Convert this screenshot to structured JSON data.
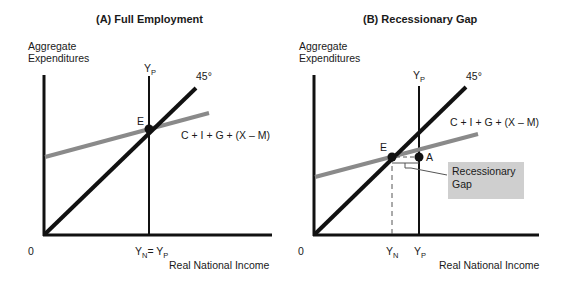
{
  "panel_a": {
    "title": "(A)  Full Employment",
    "y_axis_label_line1": "Aggregate",
    "y_axis_label_line2": "Expenditures",
    "x_axis_label": "Real National Income",
    "origin_label": "0",
    "yp_label": "Y",
    "yp_sub": "P",
    "line45_label": "45°",
    "ae_label": "C + I + G + (X – M)",
    "point_e_label": "E",
    "x_tick_label_y": "Y",
    "x_tick_sub_n": "N",
    "x_tick_eq": "= Y",
    "x_tick_sub_p": "P"
  },
  "panel_b": {
    "title": "(B)  Recessionary Gap",
    "y_axis_label_line1": "Aggregate",
    "y_axis_label_line2": "Expenditures",
    "x_axis_label": "Real National Income",
    "origin_label": "0",
    "yp_label": "Y",
    "yp_sub": "P",
    "line45_label": "45°",
    "ae_label": "C + I + G + (X – M)",
    "point_e_label": "E",
    "point_a_label": "A",
    "gap_label_line1": "Recessionary",
    "gap_label_line2": "Gap",
    "x_tick_yn": "Y",
    "x_tick_yn_sub": "N",
    "x_tick_yp": "Y",
    "x_tick_yp_sub": "P"
  },
  "colors": {
    "axis": "#111111",
    "line45": "#111111",
    "ae_line": "#8a8a8a",
    "gap_box": "#cfcfcf"
  }
}
